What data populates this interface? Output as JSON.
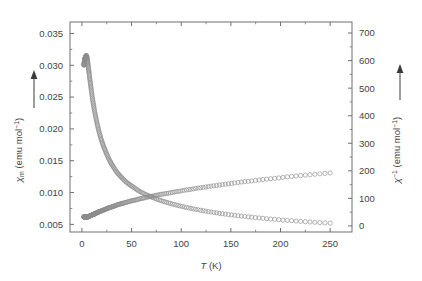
{
  "chart_data": {
    "type": "scatter",
    "title": "",
    "xlabel": "T (K)",
    "ylabel": "χm (emu mol⁻¹)",
    "y2label": "χ⁻¹ (emu mol⁻¹)",
    "xlim": [
      -12,
      272
    ],
    "ylim": [
      0.0038,
      0.0368
    ],
    "y2lim": [
      -22,
      740
    ],
    "grid": false,
    "legend": null,
    "xticks": [
      0,
      50,
      100,
      150,
      200,
      250
    ],
    "xticklabels": [
      "0",
      "50",
      "100",
      "150",
      "200",
      "250"
    ],
    "yticks": [
      0.005,
      0.01,
      0.015,
      0.02,
      0.025,
      0.03,
      0.035
    ],
    "yticklabels": [
      "0.005",
      "0.010",
      "0.015",
      "0.020",
      "0.025",
      "0.030",
      "0.035"
    ],
    "y2ticks": [
      0,
      100,
      200,
      300,
      400,
      500,
      600,
      700
    ],
    "y2ticklabels": [
      "0",
      "100",
      "200",
      "300",
      "400",
      "500",
      "600",
      "700"
    ],
    "xminor_step": 25,
    "yminor_step": 0.0025,
    "y2minor_step": 50,
    "marker": "open-circle",
    "marker_size": 2.1,
    "marker_color": "#8c8c8c",
    "series": [
      {
        "name": "χm (emu mol⁻¹)",
        "axis": "left",
        "x": [
          2.0,
          2.6,
          3.2,
          3.8,
          4.3,
          4.8,
          5.2,
          5.6,
          6.0,
          6.4,
          6.9,
          7.4,
          7.9,
          8.5,
          9.1,
          9.8,
          10.5,
          11.3,
          12.2,
          13.1,
          14.1,
          15.2,
          16.4,
          17.7,
          19.1,
          20.6,
          22.2,
          24.0,
          25.9,
          28.0,
          30.2,
          32.6,
          35.2,
          38.0,
          41.0,
          44.2,
          47.6,
          51.2,
          55.0,
          59.0,
          63.2,
          67.6,
          72.2,
          77.0,
          82.0,
          87.2,
          92.6,
          98.2,
          104.0,
          110.0,
          116.2,
          122.6,
          129.2,
          136.0,
          143.0,
          150.2,
          157.6,
          165.2,
          173.0,
          181.0,
          189.2,
          197.6,
          206.2,
          215.0,
          224.0,
          233.2,
          242.6,
          250.0
        ],
        "y": [
          0.03,
          0.0306,
          0.0311,
          0.0314,
          0.0315,
          0.0314,
          0.0311,
          0.0307,
          0.0303,
          0.0298,
          0.0292,
          0.0286,
          0.0279,
          0.0272,
          0.0265,
          0.0257,
          0.0249,
          0.0241,
          0.0233,
          0.0225,
          0.0217,
          0.0209,
          0.0201,
          0.0193,
          0.0185,
          0.0178,
          0.0171,
          0.0164,
          0.0157,
          0.015,
          0.0144,
          0.0138,
          0.0132,
          0.0127,
          0.0122,
          0.0117,
          0.0113,
          0.0109,
          0.0105,
          0.0101,
          0.00977,
          0.00946,
          0.00916,
          0.00888,
          0.00862,
          0.00837,
          0.00814,
          0.00791,
          0.0077,
          0.0075,
          0.00731,
          0.00713,
          0.00696,
          0.0068,
          0.00664,
          0.00649,
          0.00635,
          0.00622,
          0.00609,
          0.00597,
          0.00585,
          0.00574,
          0.00563,
          0.00553,
          0.00543,
          0.00534,
          0.00525,
          0.0052
        ]
      },
      {
        "name": "χ⁻¹ (emu mol⁻¹)",
        "axis": "right",
        "x": [
          2.0,
          2.6,
          3.2,
          3.8,
          4.3,
          4.8,
          5.2,
          5.6,
          6.0,
          6.4,
          6.9,
          7.4,
          7.9,
          8.5,
          9.1,
          9.8,
          10.5,
          11.3,
          12.2,
          13.1,
          14.1,
          15.2,
          16.4,
          17.7,
          19.1,
          20.6,
          22.2,
          24.0,
          25.9,
          28.0,
          30.2,
          32.6,
          35.2,
          38.0,
          41.0,
          44.2,
          47.6,
          51.2,
          55.0,
          59.0,
          63.2,
          67.6,
          72.2,
          77.0,
          82.0,
          87.2,
          92.6,
          98.2,
          104.0,
          110.0,
          116.2,
          122.6,
          129.2,
          136.0,
          143.0,
          150.2,
          157.6,
          165.2,
          173.0,
          181.0,
          189.2,
          197.6,
          206.2,
          215.0,
          224.0,
          233.2,
          242.6,
          250.0
        ],
        "y": [
          33,
          33,
          32,
          32,
          32,
          32,
          32,
          33,
          33,
          34,
          34,
          35,
          36,
          37,
          38,
          39,
          40,
          42,
          43,
          44,
          46,
          48,
          50,
          52,
          54,
          56,
          58,
          61,
          64,
          67,
          69,
          72,
          76,
          79,
          82,
          85,
          89,
          92,
          95,
          99,
          102,
          106,
          109,
          113,
          116,
          119,
          123,
          126,
          130,
          133,
          137,
          140,
          144,
          147,
          151,
          154,
          158,
          161,
          164,
          168,
          171,
          174,
          178,
          181,
          184,
          187,
          190,
          192
        ]
      }
    ],
    "left_axis_arrow": "up",
    "right_axis_arrow": "up"
  },
  "geometry": {
    "plot_left": 70,
    "plot_right": 352,
    "plot_top": 22,
    "plot_bottom": 232
  }
}
